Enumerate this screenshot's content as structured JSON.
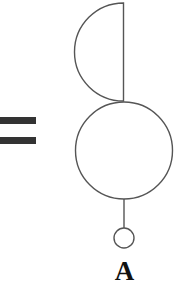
{
  "diagram": {
    "type": "symbol-composition",
    "equals_sign": {
      "symbol": "=",
      "color": "#333333"
    },
    "shapes": [
      {
        "kind": "semicircle",
        "side": "left",
        "description": "half circle with vertical diameter at right"
      },
      {
        "kind": "circle",
        "size": "large"
      },
      {
        "kind": "stem",
        "description": "vertical line from large circle to small circle"
      },
      {
        "kind": "circle",
        "size": "small"
      }
    ],
    "label": "A",
    "stroke_color": "#555555"
  }
}
